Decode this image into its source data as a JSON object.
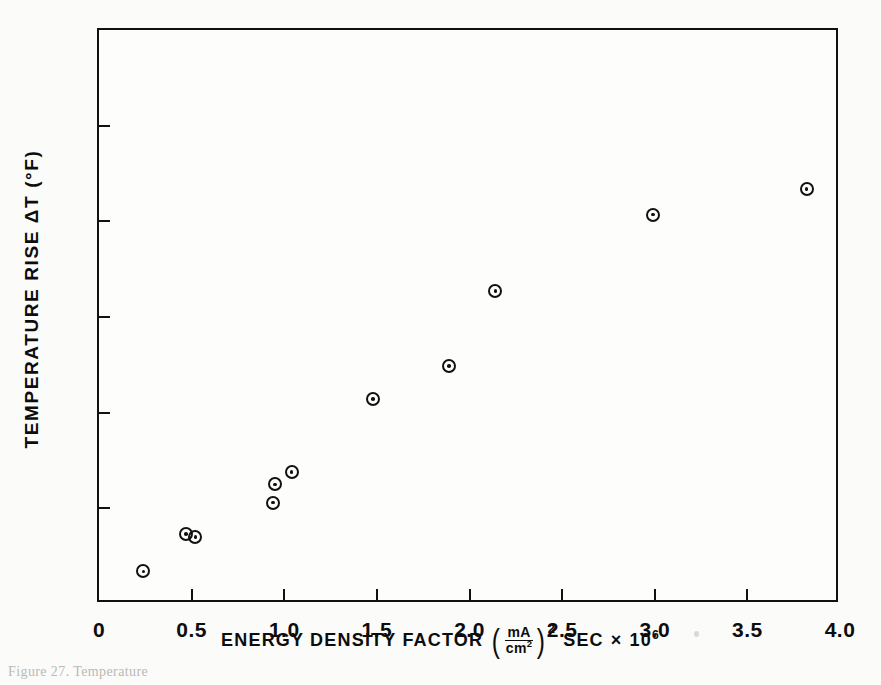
{
  "figure": {
    "background_color": "#fbfbf9",
    "ink_color": "#111111",
    "caption_partial": "Figure 27.  Temperature"
  },
  "chart_data": {
    "type": "scatter",
    "title": "",
    "xlabel": "ENERGY DENSITY FACTOR (mA/cm2)2 SEC x 10^6",
    "ylabel": "TEMPERATURE RISE ΔT (°F)",
    "xlim": [
      0,
      4.0
    ],
    "ylim": [
      0,
      60
    ],
    "xticks": [
      0,
      0.5,
      1.0,
      1.5,
      2.0,
      2.5,
      3.0,
      3.5,
      4.0
    ],
    "xticklabels": [
      "0",
      "0.5",
      "1.0",
      "1.5",
      "2.0",
      "2.5",
      "3.0",
      "3.5",
      "4.0"
    ],
    "yticks": [
      0,
      10,
      20,
      30,
      40,
      50,
      60
    ],
    "yticklabels": [
      "0",
      "10",
      "20",
      "30",
      "40",
      "50",
      "60"
    ],
    "grid": false,
    "legend": false,
    "marker": "circle-with-center-dot",
    "points": [
      {
        "x": 0.24,
        "y": 3.4
      },
      {
        "x": 0.47,
        "y": 7.3
      },
      {
        "x": 0.52,
        "y": 7.0
      },
      {
        "x": 0.94,
        "y": 10.6
      },
      {
        "x": 0.95,
        "y": 12.5
      },
      {
        "x": 1.04,
        "y": 13.8
      },
      {
        "x": 1.48,
        "y": 21.4
      },
      {
        "x": 1.89,
        "y": 24.9
      },
      {
        "x": 2.14,
        "y": 32.7
      },
      {
        "x": 2.99,
        "y": 40.7
      },
      {
        "x": 3.82,
        "y": 43.4
      }
    ]
  },
  "axis_title_parts": {
    "x_lead": "ENERGY DENSITY FACTOR",
    "x_frac_numerator": "mA",
    "x_frac_denominator": "cm",
    "x_frac_denominator_exp": "2",
    "x_paren_exp": "2",
    "x_tail": "SEC",
    "x_times": "×",
    "x_power_base": "10",
    "x_power_exp": "6"
  }
}
